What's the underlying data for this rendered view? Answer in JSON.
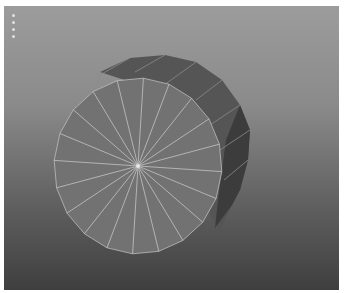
{
  "viewport": {
    "type": "3d-viewport",
    "background_top": "#9c9c9c",
    "background_bottom": "#3f3f3f"
  },
  "toolbar": {
    "handle_dots": 4
  },
  "object": {
    "type": "cylinder",
    "segments": 20,
    "face_color": "#6f6f6f",
    "side_color": "#555555",
    "side_dark_color": "#3a3a3a",
    "wire_color": "#c8c8c8",
    "cap_center": [
      138,
      166
    ]
  }
}
